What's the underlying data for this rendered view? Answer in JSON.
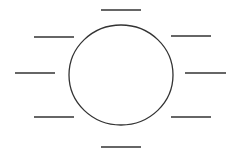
{
  "diagram": {
    "type": "circle-with-blank-label-lines",
    "stroke_color": "#333333",
    "background": "#ffffff",
    "center_circle": {
      "cx": 121,
      "cy": 75,
      "rx": 52,
      "ry": 50
    },
    "blank_lines": [
      {
        "id": "top",
        "x1": 101,
        "x2": 141,
        "y": 10
      },
      {
        "id": "upper-left",
        "x1": 34,
        "x2": 74,
        "y": 37
      },
      {
        "id": "left",
        "x1": 15,
        "x2": 55,
        "y": 73
      },
      {
        "id": "lower-left",
        "x1": 34,
        "x2": 74,
        "y": 117
      },
      {
        "id": "bottom",
        "x1": 101,
        "x2": 141,
        "y": 147
      },
      {
        "id": "upper-right",
        "x1": 171,
        "x2": 211,
        "y": 36
      },
      {
        "id": "right",
        "x1": 185,
        "x2": 226,
        "y": 73
      },
      {
        "id": "lower-right",
        "x1": 171,
        "x2": 211,
        "y": 117
      }
    ]
  }
}
